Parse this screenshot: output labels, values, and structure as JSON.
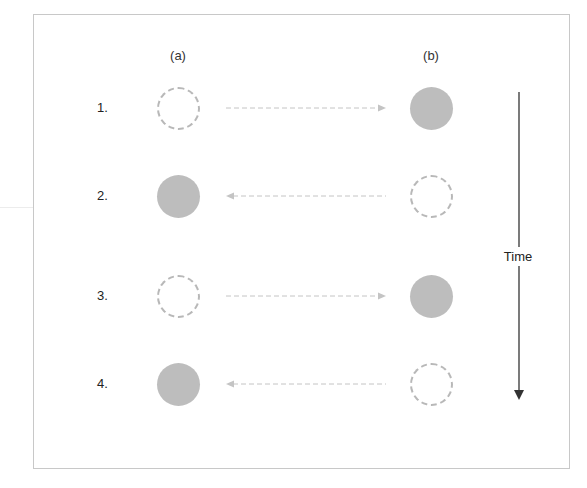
{
  "diagram": {
    "column_labels": [
      {
        "id": "a",
        "label": "(a)",
        "x": 178,
        "y": 48
      },
      {
        "id": "b",
        "label": "(b)",
        "x": 431,
        "y": 48
      }
    ],
    "rows": [
      {
        "label": "1.",
        "y": 108,
        "a_state": "empty",
        "b_state": "filled",
        "arrow_direction": "right"
      },
      {
        "label": "2.",
        "y": 196,
        "a_state": "filled",
        "b_state": "empty",
        "arrow_direction": "left"
      },
      {
        "label": "3.",
        "y": 296,
        "a_state": "empty",
        "b_state": "filled",
        "arrow_direction": "right"
      },
      {
        "label": "4.",
        "y": 384,
        "a_state": "filled",
        "b_state": "empty",
        "arrow_direction": "left"
      }
    ],
    "time_axis": {
      "label": "Time",
      "direction": "down"
    },
    "colors": {
      "filled_circle": "#bdbdbd",
      "dashed_circle": "#b8b8b8",
      "dashed_arrow": "#c4c4c4",
      "time_arrow": "#333333",
      "frame_border": "#c8c8c8"
    },
    "caption": ""
  }
}
